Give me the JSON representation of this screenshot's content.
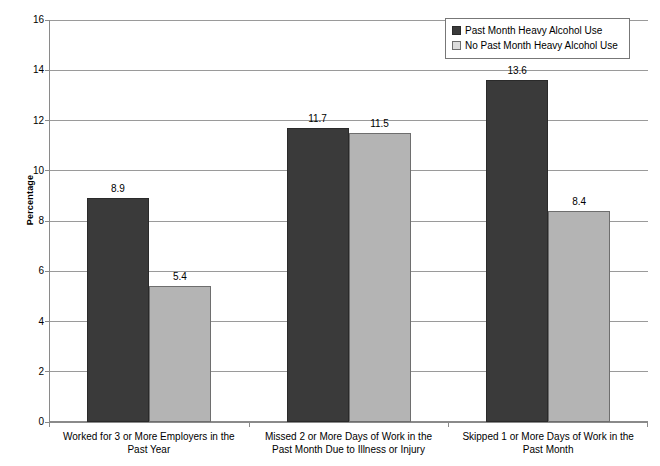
{
  "chart_data": {
    "type": "bar",
    "title": "",
    "xlabel": "",
    "ylabel": "Percentage",
    "ylim": [
      0,
      16
    ],
    "ytick_step": 2,
    "yticks": [
      0,
      2,
      4,
      6,
      8,
      10,
      12,
      14,
      16
    ],
    "ytick_labels": [
      "0",
      "2",
      "4",
      "6",
      "8",
      "10",
      "12",
      "14",
      "16"
    ],
    "grid": true,
    "legend_position": "top-right",
    "categories": [
      "Worked for 3 or More Employers in the Past Year",
      "Missed 2 or More Days of Work in the Past Month Due to Illness or Injury",
      "Skipped 1 or More Days of Work in the Past Month"
    ],
    "category_lines": [
      [
        "Worked for 3 or More Employers in the",
        "Past Year"
      ],
      [
        "Missed 2 or More Days of Work in the",
        "Past Month Due to Illness or Injury"
      ],
      [
        "Skipped 1 or More Days of Work in the",
        "Past Month"
      ]
    ],
    "series": [
      {
        "name": "Past Month Heavy Alcohol Use",
        "color": "#3a3a3a",
        "values": [
          8.9,
          11.7,
          13.6
        ],
        "labels": [
          "8.9",
          "11.7",
          "13.6"
        ]
      },
      {
        "name": "No Past Month Heavy Alcohol Use",
        "color": "#b4b4b4",
        "values": [
          5.4,
          11.5,
          8.4
        ],
        "labels": [
          "5.4",
          "11.5",
          "8.4"
        ]
      }
    ]
  },
  "legend": {
    "items": [
      {
        "label": "Past Month Heavy Alcohol Use",
        "swatch": "dark"
      },
      {
        "label": "No Past Month Heavy Alcohol Use",
        "swatch": "light"
      }
    ]
  },
  "axis": {
    "y_title": "Percentage"
  }
}
